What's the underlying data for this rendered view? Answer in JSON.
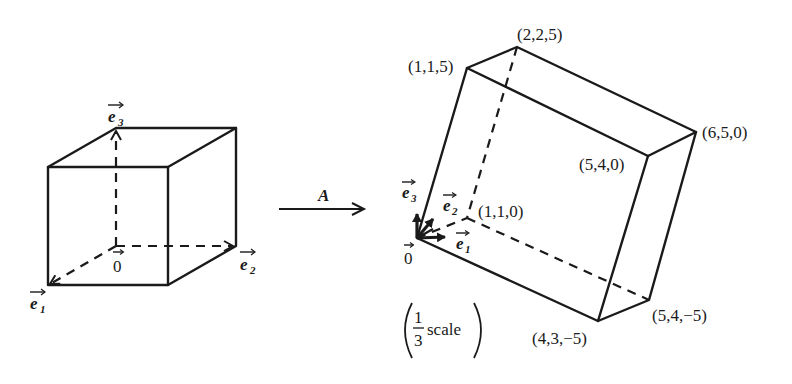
{
  "figure": {
    "left_cube": {
      "basis_labels": {
        "e1": "e",
        "e1_sub": "1",
        "e2": "e",
        "e2_sub": "2",
        "e3": "e",
        "e3_sub": "3",
        "origin": "0"
      }
    },
    "transform_arrow": {
      "label": "A"
    },
    "right_parallelepiped": {
      "vertex_labels": {
        "v115": "(1,1,5)",
        "v225": "(2,2,5)",
        "v650": "(6,5,0)",
        "v540": "(5,4,0)",
        "v110": "(1,1,0)",
        "v43m5": "(4,3,−5)",
        "v54m5": "(5,4,−5)"
      },
      "basis_labels": {
        "e1": "e",
        "e1_sub": "1",
        "e2": "e",
        "e2_sub": "2",
        "e3": "e",
        "e3_sub": "3",
        "origin": "0"
      },
      "scale_note": {
        "numerator": "1",
        "denominator": "3",
        "word": "scale"
      }
    }
  }
}
